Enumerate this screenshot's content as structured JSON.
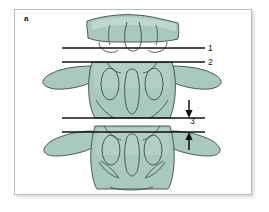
{
  "figure": {
    "panel_letter": "a",
    "caption_subject": "lumbar vertebrae, anteroposterior view",
    "background_color": "#ffffff",
    "frame_color": "#bdbdbd"
  },
  "colors": {
    "bone_fill": "#a9c9bd",
    "bone_fill_light": "#bcd6cc",
    "bone_outline": "#3c4b46",
    "measure_line": "#121212",
    "label_text": "#111111"
  },
  "labels": {
    "panel": "a",
    "callout_1": "1",
    "callout_2": "2",
    "callout_3": "3"
  },
  "measurement_lines": [
    {
      "id": "line-1",
      "label": "1",
      "y": 48,
      "x_start": 62,
      "x_end": 205
    },
    {
      "id": "line-2",
      "label": "2",
      "y": 62,
      "x_start": 62,
      "x_end": 205
    },
    {
      "id": "line-3-upper",
      "label": "3",
      "y": 118,
      "x_start": 62,
      "x_end": 205
    },
    {
      "id": "line-3-lower",
      "label": "3",
      "y": 132,
      "x_start": 62,
      "x_end": 205
    }
  ],
  "arrows": [
    {
      "id": "arrow-upper",
      "direction": "down",
      "x": 189,
      "y_start": 100,
      "y_end": 117
    },
    {
      "id": "arrow-lower",
      "direction": "up",
      "x": 189,
      "y_start": 150,
      "y_end": 133
    }
  ],
  "vertebrae": [
    {
      "id": "vertebra-top",
      "name": "superior vertebra (partial)"
    },
    {
      "id": "vertebra-middle",
      "name": "middle vertebra"
    },
    {
      "id": "vertebra-bottom",
      "name": "inferior vertebra"
    }
  ]
}
